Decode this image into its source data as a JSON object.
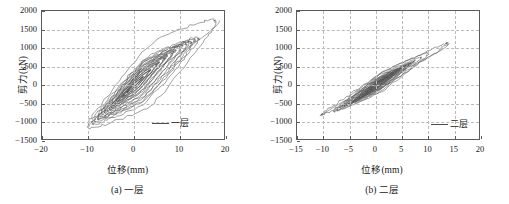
{
  "figure": {
    "panels": [
      {
        "id": "panel-a",
        "caption": "(a)  一层",
        "legend_label": "一层",
        "chart_data": {
          "type": "line",
          "title": "",
          "subtitle": "",
          "xlabel": "位移(mm)",
          "ylabel": "剪力(kN)",
          "xlim": [
            -20,
            20
          ],
          "ylim": [
            -1500,
            2000
          ],
          "xticks": [
            -20,
            -10,
            0,
            10,
            20
          ],
          "yticks": [
            -1500,
            -1000,
            -500,
            0,
            500,
            1000,
            1500,
            2000
          ],
          "xticklabels": [
            "-20",
            "-10",
            "0",
            "10",
            "20"
          ],
          "yticklabels": [
            "-1500",
            "-1000",
            "-500",
            "0",
            "500",
            "1000",
            "1500",
            "2000"
          ],
          "grid": true,
          "legend_position": "lower right",
          "series": [
            {
              "name": "一层",
              "description": "hysteresis loops, shear force vs displacement",
              "loops": [
                {
                  "xpos": 2.0,
                  "ypos": 230,
                  "xneg": -1.6,
                  "yneg": -200,
                  "fat": 0.22,
                  "n": 3
                },
                {
                  "xpos": 3.6,
                  "ypos": 420,
                  "xneg": -2.6,
                  "yneg": -330,
                  "fat": 0.26,
                  "n": 3
                },
                {
                  "xpos": 5.4,
                  "ypos": 620,
                  "xneg": -3.6,
                  "yneg": -450,
                  "fat": 0.3,
                  "n": 3
                },
                {
                  "xpos": 7.2,
                  "ypos": 800,
                  "xneg": -4.8,
                  "yneg": -580,
                  "fat": 0.34,
                  "n": 3
                },
                {
                  "xpos": 9.0,
                  "ypos": 950,
                  "xneg": -5.8,
                  "yneg": -690,
                  "fat": 0.38,
                  "n": 3
                },
                {
                  "xpos": 10.6,
                  "ypos": 1070,
                  "xneg": -6.8,
                  "yneg": -790,
                  "fat": 0.42,
                  "n": 2
                },
                {
                  "xpos": 12.0,
                  "ypos": 1150,
                  "xneg": -7.8,
                  "yneg": -880,
                  "fat": 0.46,
                  "n": 2
                },
                {
                  "xpos": 13.2,
                  "ypos": 1210,
                  "xneg": -8.6,
                  "yneg": -950,
                  "fat": 0.5,
                  "n": 2
                },
                {
                  "xpos": 14.0,
                  "ypos": 1250,
                  "xneg": -9.2,
                  "yneg": -1010,
                  "fat": 0.54,
                  "n": 1
                },
                {
                  "xpos": 17.8,
                  "ypos": 1700,
                  "xneg": -10.0,
                  "yneg": -1090,
                  "fat": 0.6,
                  "n": 1
                }
              ],
              "envelope": {
                "x_max": 18.6,
                "y_max": 1740,
                "x_min": -10.2,
                "y_min": -1110
              }
            }
          ]
        }
      },
      {
        "id": "panel-b",
        "caption": "(b)  二层",
        "legend_label": "二层",
        "chart_data": {
          "type": "line",
          "title": "",
          "subtitle": "",
          "xlabel": "位移(mm)",
          "ylabel": "剪力(kN)",
          "xlim": [
            -15,
            20
          ],
          "ylim": [
            -1500,
            2000
          ],
          "xticks": [
            -15,
            -10,
            -5,
            0,
            5,
            10,
            15,
            20
          ],
          "yticks": [
            -1500,
            -1000,
            -500,
            0,
            500,
            1000,
            1500,
            2000
          ],
          "xticklabels": [
            "-15",
            "-10",
            "-5",
            "0",
            "5",
            "10",
            "15",
            "20"
          ],
          "yticklabels": [
            "-1500",
            "-1000",
            "-500",
            "0",
            "500",
            "1000",
            "1500",
            "2000"
          ],
          "grid": true,
          "legend_position": "lower right",
          "series": [
            {
              "name": "二层",
              "description": "hysteresis loops, shear force vs displacement",
              "loops": [
                {
                  "xpos": 1.4,
                  "ypos": 150,
                  "xneg": -1.2,
                  "yneg": -130,
                  "fat": 0.16,
                  "n": 3
                },
                {
                  "xpos": 2.4,
                  "ypos": 240,
                  "xneg": -2.0,
                  "yneg": -210,
                  "fat": 0.18,
                  "n": 3
                },
                {
                  "xpos": 3.4,
                  "ypos": 330,
                  "xneg": -2.8,
                  "yneg": -290,
                  "fat": 0.2,
                  "n": 3
                },
                {
                  "xpos": 4.2,
                  "ypos": 400,
                  "xneg": -3.6,
                  "yneg": -360,
                  "fat": 0.22,
                  "n": 3
                },
                {
                  "xpos": 5.0,
                  "ypos": 470,
                  "xneg": -4.4,
                  "yneg": -430,
                  "fat": 0.24,
                  "n": 3
                },
                {
                  "xpos": 5.8,
                  "ypos": 530,
                  "xneg": -5.2,
                  "yneg": -490,
                  "fat": 0.26,
                  "n": 2
                },
                {
                  "xpos": 6.6,
                  "ypos": 590,
                  "xneg": -6.0,
                  "yneg": -550,
                  "fat": 0.28,
                  "n": 2
                },
                {
                  "xpos": 7.4,
                  "ypos": 650,
                  "xneg": -6.8,
                  "yneg": -610,
                  "fat": 0.3,
                  "n": 2
                },
                {
                  "xpos": 8.6,
                  "ypos": 740,
                  "xneg": -7.4,
                  "yneg": -660,
                  "fat": 0.32,
                  "n": 1
                },
                {
                  "xpos": 10.0,
                  "ypos": 860,
                  "xneg": -8.0,
                  "yneg": -700,
                  "fat": 0.34,
                  "n": 1
                },
                {
                  "xpos": 13.6,
                  "ypos": 1130,
                  "xneg": -10.4,
                  "yneg": -790,
                  "fat": 0.2,
                  "n": 1
                }
              ],
              "envelope": {
                "x_max": 13.8,
                "y_max": 1150,
                "x_min": -10.6,
                "y_min": -810
              }
            }
          ]
        }
      }
    ]
  },
  "colors": {
    "curve": "#555555",
    "axis": "#5a5a5a",
    "grid": "#b9b9b9",
    "text": "#1a1a1a"
  }
}
